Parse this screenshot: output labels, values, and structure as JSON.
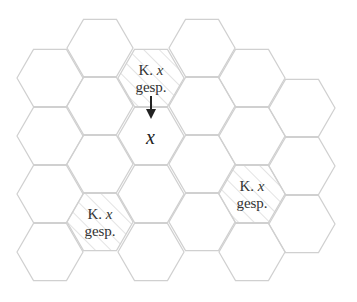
{
  "diagram": {
    "type": "hexagonal-cell-grid",
    "colors": {
      "stroke": "#d0d0d0",
      "hatch": "#c8c8c8",
      "text": "#333333",
      "arrow": "#222222"
    },
    "hex_radius": 33,
    "columns": [
      {
        "cx": 50,
        "centers": [
          78,
          136,
          194,
          252
        ]
      },
      {
        "cx": 100,
        "centers": [
          48,
          106,
          164,
          222
        ]
      },
      {
        "cx": 151,
        "centers": [
          78,
          136,
          194,
          252
        ]
      },
      {
        "cx": 202,
        "centers": [
          48,
          106,
          164,
          222
        ]
      },
      {
        "cx": 252,
        "centers": [
          78,
          136,
          194,
          252
        ]
      },
      {
        "cx": 302,
        "centers": [
          108,
          166,
          224
        ]
      }
    ],
    "hatched_cells": [
      {
        "cx": 151,
        "cy": 78,
        "line1_prefix": "K. ",
        "line1_var": "x",
        "line2": "gesp."
      },
      {
        "cx": 100,
        "cy": 222,
        "line1_prefix": "K. ",
        "line1_var": "x",
        "line2": "gesp."
      },
      {
        "cx": 252,
        "cy": 194,
        "line1_prefix": "K. ",
        "line1_var": "x",
        "line2": "gesp."
      }
    ],
    "target_cell": {
      "cx": 151,
      "cy": 136,
      "label": "x"
    }
  },
  "labels": {
    "top": {
      "prefix": "K. ",
      "var": "x",
      "line2": "gesp."
    },
    "bottom_left": {
      "prefix": "K. ",
      "var": "x",
      "line2": "gesp."
    },
    "right": {
      "prefix": "K. ",
      "var": "x",
      "line2": "gesp."
    },
    "target": "x"
  }
}
